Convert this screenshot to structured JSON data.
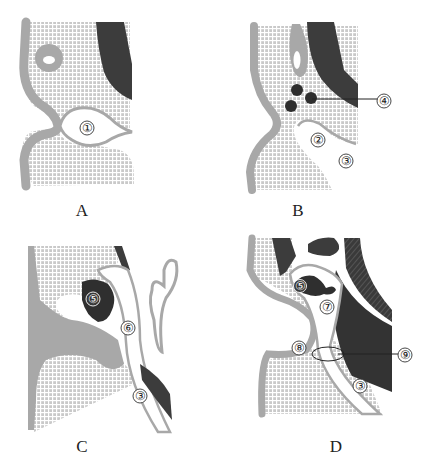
{
  "figure": {
    "colors": {
      "background": "#ffffff",
      "mesoderm_grid": "#c8c8c8",
      "grid_line": "#ffffff",
      "ectoderm_band": "#a8a8a8",
      "dark_tissue": "#3c3c3c",
      "label_circle": "#ffffff"
    },
    "panels": [
      {
        "id": "A",
        "label": "A",
        "markers": [
          {
            "num": "①"
          }
        ]
      },
      {
        "id": "B",
        "label": "B",
        "markers": [
          {
            "num": "②"
          },
          {
            "num": "③"
          },
          {
            "num": "④"
          }
        ]
      },
      {
        "id": "C",
        "label": "C",
        "markers": [
          {
            "num": "⑤"
          },
          {
            "num": "⑥"
          },
          {
            "num": "③"
          }
        ]
      },
      {
        "id": "D",
        "label": "D",
        "markers": [
          {
            "num": "⑤"
          },
          {
            "num": "⑦"
          },
          {
            "num": "⑧"
          },
          {
            "num": "⑨"
          },
          {
            "num": "③"
          }
        ]
      }
    ]
  }
}
